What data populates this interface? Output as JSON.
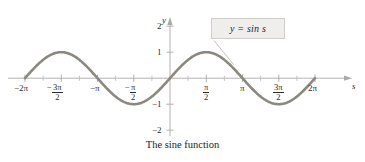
{
  "figure": {
    "caption": "The sine function",
    "callout_label": "y = sin s",
    "axis_y_name": "y",
    "axis_x_name": "s"
  },
  "chart_data": {
    "type": "line",
    "title": "The sine function",
    "function": "y = sin s",
    "xlabel": "s",
    "ylabel": "y",
    "xlim": [
      -6.2831853,
      6.2831853
    ],
    "ylim": [
      -2.4,
      2.4
    ],
    "grid": false,
    "legend": "annotation-box",
    "legend_position": "top-right",
    "x_tick_values": [
      -6.2831853,
      -4.712389,
      -3.1415927,
      -1.5707963,
      0,
      1.5707963,
      3.1415927,
      4.712389,
      6.2831853
    ],
    "x_tick_labels": [
      "-2π",
      "-3π/2",
      "-π",
      "-π/2",
      "",
      "π/2",
      "π",
      "3π/2",
      "2π"
    ],
    "x_minor_ticks": [
      -5.4977871,
      -3.9269908,
      -2.3561945,
      -0.7853982,
      0.7853982,
      2.3561945,
      3.9269908,
      5.4977871
    ],
    "y_tick_values": [
      -2,
      -1,
      1,
      2
    ],
    "y_tick_labels": [
      "-2",
      "-1",
      "1",
      "2"
    ],
    "series": [
      {
        "name": "y = sin s",
        "color": "#8c8880",
        "linewidth": 2.6,
        "x": [
          -6.2831853,
          -5.8904862,
          -5.4977871,
          -5.1050881,
          -4.712389,
          -4.3196899,
          -3.9269908,
          -3.5342917,
          -3.1415927,
          -2.7488936,
          -2.3561945,
          -1.9634954,
          -1.5707963,
          -1.1780972,
          -0.7853982,
          -0.3926991,
          0,
          0.3926991,
          0.7853982,
          1.1780972,
          1.5707963,
          1.9634954,
          2.3561945,
          2.7488936,
          3.1415927,
          3.5342917,
          3.9269908,
          4.3196899,
          4.712389,
          5.1050881,
          5.4977871,
          5.8904862,
          6.2831853
        ],
        "y": [
          0,
          0.3827,
          0.7071,
          0.9239,
          1,
          0.9239,
          0.7071,
          0.3827,
          0,
          -0.3827,
          -0.7071,
          -0.9239,
          -1,
          -0.9239,
          -0.7071,
          -0.3827,
          0,
          0.3827,
          0.7071,
          0.9239,
          1,
          0.9239,
          0.7071,
          0.3827,
          0,
          -0.3827,
          -0.7071,
          -0.9239,
          -1,
          -0.9239,
          -0.7071,
          -0.3827,
          0
        ]
      }
    ],
    "annotations": [
      {
        "text": "y = sin s",
        "box": true,
        "box_fill": "#efeeec",
        "box_border": "#cfcdc9",
        "leader_to_x": 2.05,
        "leader_to_y": 0.85
      }
    ]
  },
  "labels": {
    "x": {
      "neg2pi": {
        "sign": "−",
        "value": "2π"
      },
      "neg3pi2": {
        "sign": "−",
        "num": "3π",
        "den": "2"
      },
      "negpi": {
        "sign": "−",
        "value": "π"
      },
      "negpi2": {
        "sign": "−",
        "num": "π",
        "den": "2"
      },
      "pi2": {
        "num": "π",
        "den": "2"
      },
      "pi": {
        "value": "π"
      },
      "pi32": {
        "num": "3π",
        "den": "2"
      },
      "pi2x": {
        "value": "2π"
      }
    },
    "y": {
      "two": "2",
      "one": "1",
      "negone": "−1",
      "negtwo": "−2"
    }
  },
  "colors": {
    "curve": "#8c8880",
    "axis": "#a9a9a9",
    "text": "#2b2b2b",
    "box_fill": "#efeeec",
    "box_border": "#cfcdc9",
    "background": "#ffffff"
  }
}
